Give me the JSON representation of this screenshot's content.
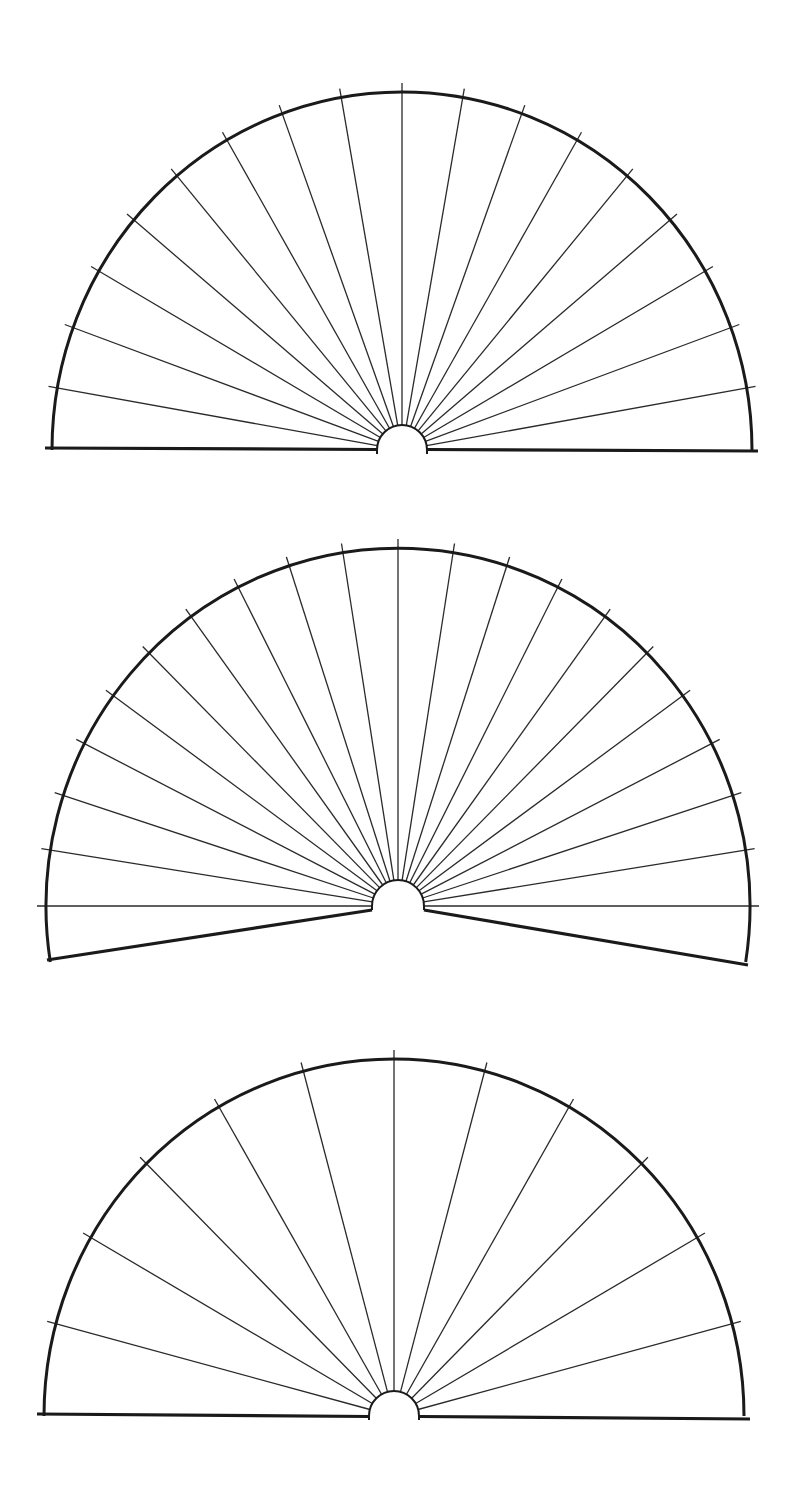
{
  "page": {
    "background": "#ffffff",
    "line_color": "#1a1a1a",
    "ray_color": "#2a2a2a"
  },
  "chart_data": [
    {
      "type": "diagram",
      "title": "",
      "name": "semicircle-fan-17",
      "description": "Semicircular pendulum/dowsing fan chart with 17 radial lines at 10 degree intervals, flat baseline",
      "center": [
        402,
        450
      ],
      "rx": 350,
      "ry": 358,
      "hub_radius": 25,
      "tick_extension": 9,
      "ray_angles_deg": [
        10,
        20,
        30,
        40,
        50,
        60,
        70,
        80,
        90,
        100,
        110,
        120,
        130,
        140,
        150,
        160,
        170
      ],
      "arc_start_deg": 0,
      "arc_end_deg": 180,
      "baseline": {
        "style": "flat",
        "left_x": 45,
        "right_x": 758,
        "left_y": 448,
        "right_y": 451
      },
      "labels": []
    },
    {
      "type": "diagram",
      "title": "",
      "name": "extended-fan-21",
      "description": "Extended fan chart with 21 radial lines at 9 degree intervals from 0 to 180 degrees; arc extends below horizontal with angled bottom edges",
      "center": [
        398,
        906
      ],
      "rx": 352,
      "ry": 358,
      "hub_radius": 26,
      "tick_extension": 9,
      "ray_angles_deg": [
        0,
        9,
        18,
        27,
        36,
        45,
        54,
        63,
        72,
        81,
        90,
        99,
        108,
        117,
        126,
        135,
        144,
        153,
        162,
        171,
        180
      ],
      "arc_start_deg": -9,
      "arc_end_deg": 189,
      "baseline": {
        "style": "angled",
        "left_corner": [
          47,
          960
        ],
        "right_corner": [
          748,
          965
        ]
      },
      "labels": []
    },
    {
      "type": "diagram",
      "title": "",
      "name": "semicircle-fan-11",
      "description": "Semicircular fan chart with 11 radial lines at 15 degree intervals, flat baseline",
      "center": [
        394,
        1416
      ],
      "rx": 350,
      "ry": 357,
      "hub_radius": 25,
      "tick_extension": 9,
      "ray_angles_deg": [
        15,
        30,
        45,
        60,
        75,
        90,
        105,
        120,
        135,
        150,
        165
      ],
      "arc_start_deg": 0,
      "arc_end_deg": 180,
      "baseline": {
        "style": "flat",
        "left_x": 37,
        "right_x": 750,
        "left_y": 1414,
        "right_y": 1419
      },
      "labels": []
    }
  ]
}
